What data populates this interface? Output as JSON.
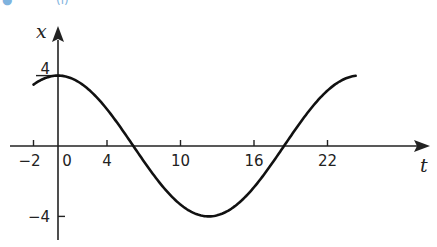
{
  "header": {
    "partial_label": "(i)",
    "color": "#7fb3de"
  },
  "chart_data": {
    "type": "line",
    "title": "",
    "xlabel": "t",
    "ylabel": "x",
    "function": "x = 4 cos(pi t / 12)",
    "x_ticks": [
      -2,
      0,
      4,
      10,
      16,
      22
    ],
    "x_tick_labels": [
      "−2",
      "0",
      "4",
      "10",
      "16",
      "22"
    ],
    "y_ticks": [
      4,
      -4
    ],
    "y_tick_labels": [
      "4",
      "−4"
    ],
    "xlim": [
      -4,
      26
    ],
    "ylim": [
      -5,
      5
    ],
    "grid": false,
    "legend": null,
    "series": [
      {
        "name": "x(t)",
        "x": [
          -2,
          0,
          2,
          4,
          6,
          8,
          10,
          12,
          14,
          16,
          18,
          20,
          22,
          24
        ],
        "values": [
          3.46,
          4,
          3.46,
          2,
          0,
          -2,
          -3.46,
          -4,
          -3.46,
          -2,
          0,
          2,
          3.46,
          4
        ]
      }
    ],
    "annotations": [
      "curve crosses t-axis at t=6 and t=18 (visually near 4-6 and 16-18)",
      "maximum 4 near t=0 and t=24, minimum -4 near t=12"
    ]
  },
  "plot": {
    "origin_px": [
      58,
      146
    ],
    "px_per_t": 12.25,
    "px_per_x": 17.6,
    "t_start": -2,
    "t_end": 24.3,
    "curve_color": "#111111",
    "axis_color": "#222222"
  }
}
